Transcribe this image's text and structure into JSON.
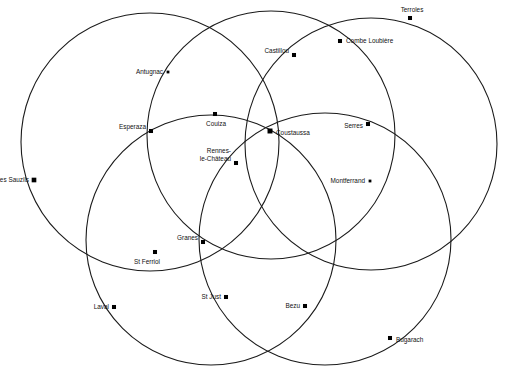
{
  "figure": {
    "background_color": "#ffffff",
    "stroke_color": "#1b1b1b",
    "dot_color": "#000000",
    "label_color": "#111111",
    "width": 506,
    "height": 366
  },
  "chart_data": {
    "type": "scatter",
    "title": "",
    "xlabel": "",
    "ylabel": "",
    "grid": false,
    "legend": "none",
    "xlim": [
      0,
      506
    ],
    "ylim": [
      0,
      366
    ],
    "circles": [
      {
        "name": "circle-northwest",
        "cx": 150,
        "cy": 142,
        "r": 129
      },
      {
        "name": "circle-north-center",
        "cx": 271,
        "cy": 135,
        "r": 124
      },
      {
        "name": "circle-northeast",
        "cx": 371,
        "cy": 144,
        "r": 126
      },
      {
        "name": "circle-southwest",
        "cx": 211,
        "cy": 240,
        "r": 125
      },
      {
        "name": "circle-southeast",
        "cx": 325,
        "cy": 239,
        "r": 126
      }
    ],
    "points": [
      {
        "name": "les-sauzils",
        "label": "les Sauzils",
        "x": 34,
        "y": 180,
        "dot": 3.0,
        "anchor": "end",
        "lx": 29,
        "ly": 180,
        "lines": [
          "les Sauzils"
        ]
      },
      {
        "name": "antugnac",
        "label": "Antugnac",
        "x": 168,
        "y": 72,
        "dot": 1.8,
        "anchor": "end",
        "lx": 163,
        "ly": 72,
        "lines": [
          "Antugnac"
        ]
      },
      {
        "name": "esperaza",
        "label": "Esperaza",
        "x": 151,
        "y": 131,
        "dot": 2.6,
        "anchor": "end",
        "lx": 146,
        "ly": 127,
        "lines": [
          "Esperaza"
        ]
      },
      {
        "name": "couiza",
        "label": "Couiza",
        "x": 215,
        "y": 114,
        "dot": 2.6,
        "anchor": "middle",
        "lx": 216,
        "ly": 124,
        "lines": [
          "Couiza"
        ]
      },
      {
        "name": "rennes-le-chateau",
        "label": "Rennes-le-Château",
        "x": 236,
        "y": 163,
        "dot": 2.6,
        "anchor": "end",
        "lx": 231,
        "ly": 155,
        "lines": [
          "Rennes-",
          "le-Château"
        ]
      },
      {
        "name": "castillou",
        "label": "Castillou",
        "x": 294,
        "y": 55,
        "dot": 2.6,
        "anchor": "end",
        "lx": 289,
        "ly": 51,
        "lines": [
          "Castillou"
        ]
      },
      {
        "name": "combe-loubiere",
        "label": "Combe Loubière",
        "x": 340,
        "y": 41,
        "dot": 2.6,
        "anchor": "start",
        "lx": 346,
        "ly": 41,
        "lines": [
          "Combe Loubière"
        ]
      },
      {
        "name": "terroles",
        "label": "Terroles",
        "x": 410,
        "y": 18,
        "dot": 2.6,
        "anchor": "middle",
        "lx": 412,
        "ly": 10,
        "lines": [
          "Terroles"
        ]
      },
      {
        "name": "coustaussa",
        "label": "Coustaussa",
        "x": 270,
        "y": 131,
        "dot": 3.2,
        "anchor": "start",
        "lx": 276,
        "ly": 133,
        "lines": [
          "Coustaussa"
        ]
      },
      {
        "name": "serres",
        "label": "Serres",
        "x": 368,
        "y": 124,
        "dot": 2.6,
        "anchor": "end",
        "lx": 363,
        "ly": 126,
        "lines": [
          "Serres"
        ]
      },
      {
        "name": "montferrand",
        "label": "Montferrand",
        "x": 370,
        "y": 181,
        "dot": 1.8,
        "anchor": "end",
        "lx": 365,
        "ly": 181,
        "lines": [
          "Montferrand"
        ]
      },
      {
        "name": "granes",
        "label": "Granes",
        "x": 203,
        "y": 242,
        "dot": 2.6,
        "anchor": "end",
        "lx": 198,
        "ly": 238,
        "lines": [
          "Granes"
        ]
      },
      {
        "name": "st-ferriol",
        "label": "St Ferriol",
        "x": 155,
        "y": 252,
        "dot": 2.6,
        "anchor": "middle",
        "lx": 147,
        "ly": 262,
        "lines": [
          "St Ferriol"
        ]
      },
      {
        "name": "laval",
        "label": "Laval",
        "x": 114,
        "y": 307,
        "dot": 2.6,
        "anchor": "end",
        "lx": 109,
        "ly": 307,
        "lines": [
          "Laval"
        ]
      },
      {
        "name": "st-just",
        "label": "St Just",
        "x": 226,
        "y": 297,
        "dot": 2.6,
        "anchor": "end",
        "lx": 221,
        "ly": 297,
        "lines": [
          "St Just"
        ]
      },
      {
        "name": "bezu",
        "label": "Bezu",
        "x": 305,
        "y": 306,
        "dot": 2.6,
        "anchor": "end",
        "lx": 300,
        "ly": 306,
        "lines": [
          "Bezu"
        ]
      },
      {
        "name": "bugarach",
        "label": "Bugarach",
        "x": 390,
        "y": 338,
        "dot": 2.6,
        "anchor": "start",
        "lx": 396,
        "ly": 340,
        "lines": [
          "Bugarach"
        ]
      }
    ]
  }
}
